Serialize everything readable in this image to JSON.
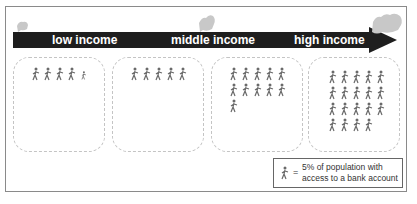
{
  "diagram": {
    "stages": [
      {
        "label": "low income",
        "figure_count": 5,
        "partial_last": true
      },
      {
        "label": "middle income",
        "figure_count": 5,
        "partial_last": false
      },
      {
        "label": "high income",
        "figure_count": 11,
        "partial_last": false
      },
      {
        "label": "",
        "figure_count": 19,
        "partial_last": false
      }
    ],
    "arrow_labels": [
      "low income",
      "middle income",
      "high income"
    ],
    "legend": {
      "symbol": "walking-person-icon",
      "equals": "=",
      "text": "5% of population with access to a bank account"
    },
    "colors": {
      "arrow": "#1e1e1e",
      "arrow_text": "#ffffff",
      "box_border": "#c4c4c4",
      "figure": "#6a6a6a",
      "money_icon": "#c8c8c8"
    }
  }
}
